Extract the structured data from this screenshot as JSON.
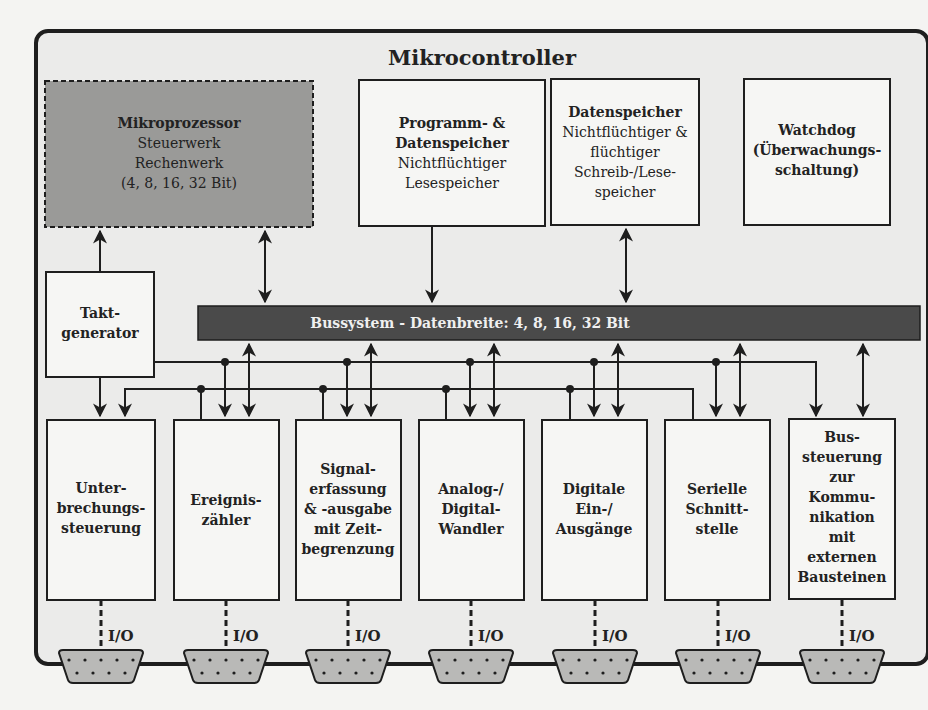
{
  "diagram": {
    "title": "Mikrocontroller",
    "colors": {
      "page_bg": "#f4f4f2",
      "frame_bg": "#ebebea",
      "frame_stroke": "#1e1e1e",
      "box_fill": "#f6f6f4",
      "processor_fill": "#9a9a98",
      "bus_fill": "#4a4a4a",
      "bus_text": "#f0f0f0",
      "connector_fill": "#b9b9b7"
    },
    "top_blocks": [
      {
        "id": "mikroprozessor",
        "lines": [
          {
            "text": "Mikroprozessor",
            "bold": true
          },
          {
            "text": "Steuerwerk",
            "bold": false
          },
          {
            "text": "Rechenwerk",
            "bold": false
          },
          {
            "text": "(4, 8, 16, 32 Bit)",
            "bold": false
          }
        ],
        "style": "dashed-gray"
      },
      {
        "id": "programmspeicher",
        "lines": [
          {
            "text": "Programm- &",
            "bold": true
          },
          {
            "text": "Datenspeicher",
            "bold": true
          },
          {
            "text": "Nichtflüchtiger",
            "bold": false
          },
          {
            "text": "Lesespeicher",
            "bold": false
          }
        ]
      },
      {
        "id": "datenspeicher",
        "lines": [
          {
            "text": "Datenspeicher",
            "bold": true
          },
          {
            "text": "Nichtflüchtiger &",
            "bold": false
          },
          {
            "text": "flüchtiger",
            "bold": false
          },
          {
            "text": "Schreib-/Lese-",
            "bold": false
          },
          {
            "text": "speicher",
            "bold": false
          }
        ]
      },
      {
        "id": "watchdog",
        "lines": [
          {
            "text": "Watchdog",
            "bold": true
          },
          {
            "text": "(Überwachungs-",
            "bold": true
          },
          {
            "text": "schaltung)",
            "bold": true
          }
        ]
      }
    ],
    "clock": {
      "lines": [
        "Takt-",
        "generator"
      ]
    },
    "bus": {
      "label": "Bussystem - Datenbreite: 4, 8, 16, 32 Bit"
    },
    "peripherals": [
      {
        "id": "unterbrechung",
        "lines": [
          "Unter-",
          "brechungs-",
          "steuerung"
        ],
        "io": "I/O"
      },
      {
        "id": "ereigniszaehler",
        "lines": [
          "Ereignis-",
          "zähler"
        ],
        "io": "I/O"
      },
      {
        "id": "signalerfassung",
        "lines": [
          "Signal-",
          "erfassung",
          "& -ausgabe",
          "mit Zeit-",
          "begrenzung"
        ],
        "io": "I/O"
      },
      {
        "id": "adwandler",
        "lines": [
          "Analog-/",
          "Digital-",
          "Wandler"
        ],
        "io": "I/O"
      },
      {
        "id": "digitale-io",
        "lines": [
          "Digitale",
          "Ein-/",
          "Ausgänge"
        ],
        "io": "I/O"
      },
      {
        "id": "serielle-schnittstelle",
        "lines": [
          "Serielle",
          "Schnitt-",
          "stelle"
        ],
        "io": "I/O"
      },
      {
        "id": "bussteuerung",
        "lines": [
          "Bus-",
          "steuerung",
          "zur",
          "Kommu-",
          "nikation",
          "mit",
          "externen",
          "Bausteinen"
        ],
        "io": "I/O"
      }
    ]
  }
}
